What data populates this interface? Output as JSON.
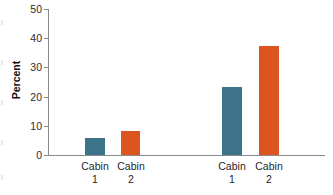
{
  "chart_data": {
    "type": "bar",
    "title": "",
    "subtitle": "",
    "xlabel": "",
    "ylabel": "Percent",
    "ylim": [
      0,
      50
    ],
    "yticks": [
      0,
      10,
      20,
      30,
      40,
      50
    ],
    "ytick_labels": [
      "0",
      "10",
      "20",
      "30",
      "40",
      "50"
    ],
    "grid": false,
    "legend": "none",
    "groups": [
      {
        "name": "group-1",
        "bars": [
          {
            "label_line1": "Cabin",
            "label_line2": "1",
            "value": 5.8,
            "color": "#3d7389"
          },
          {
            "label_line1": "Cabin",
            "label_line2": "2",
            "value": 8.2,
            "color": "#dc5420"
          }
        ]
      },
      {
        "name": "group-2",
        "bars": [
          {
            "label_line1": "Cabin",
            "label_line2": "1",
            "value": 23.4,
            "color": "#3d7389"
          },
          {
            "label_line1": "Cabin",
            "label_line2": "2",
            "value": 37.5,
            "color": "#dc5420"
          }
        ]
      }
    ],
    "categories": [
      "Cabin 1",
      "Cabin 2",
      "Cabin 1",
      "Cabin 2"
    ],
    "values": [
      5.8,
      8.2,
      23.4,
      37.5
    ],
    "colors": {
      "series_a": "#3d7389",
      "series_b": "#dc5420",
      "axis": "#8b8b8b",
      "text": "#1f1f1f"
    }
  }
}
